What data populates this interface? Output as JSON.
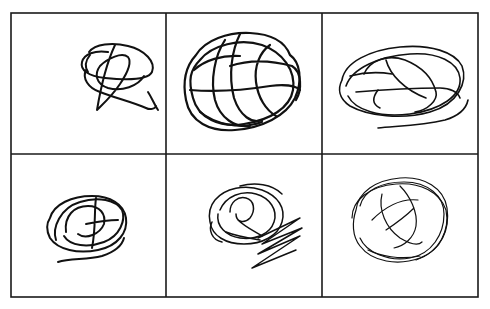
{
  "figure": {
    "layout": "3x2 grid of scribble drawings",
    "rows": 2,
    "columns": 3,
    "background_color": "#ffffff",
    "line_color": "#111111",
    "panels": [
      {
        "position": "row-1-col-1",
        "description": "small loose tangled scribble with trailing hook"
      },
      {
        "position": "row-1-col-2",
        "description": "dense heavy circular scribble"
      },
      {
        "position": "row-1-col-3",
        "description": "wide elliptical loose scribble"
      },
      {
        "position": "row-2-col-1",
        "description": "compact oval scribble"
      },
      {
        "position": "row-2-col-2",
        "description": "circular scribble with zigzag tail"
      },
      {
        "position": "row-2-col-3",
        "description": "thin-lined round scribble with crossing strokes"
      }
    ]
  }
}
